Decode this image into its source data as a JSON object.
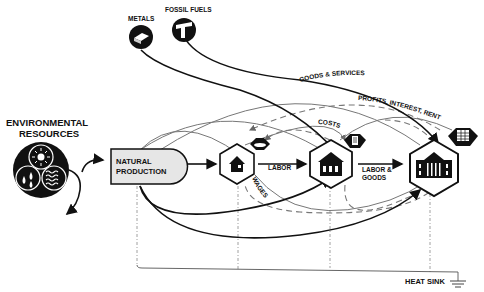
{
  "diagram": {
    "sources": {
      "metals": "METALS",
      "fossil_fuels": "FOSSIL FUELS",
      "environmental_resources_line1": "ENVIRONMENTAL",
      "environmental_resources_line2": "RESOURCES"
    },
    "nodes": {
      "natural_production_line1": "NATURAL",
      "natural_production_line2": "PRODUCTION",
      "household": "household (house icon)",
      "business": "business (building icon)",
      "government": "government (columned building icon)"
    },
    "flows": {
      "labor": "LABOR",
      "labor_goods_line1": "LABOR &",
      "labor_goods_line2": "GOODS",
      "wages": "WAGES",
      "costs": "COSTS",
      "goods_services": "GOODS & SERVICES",
      "profits": "PROFITS, INTEREST, RENT"
    },
    "sink": {
      "heat_sink": "HEAT SINK"
    },
    "colors": {
      "ink": "#111111",
      "secondary_flow": "#777777",
      "production_fill": "#e6e6e6"
    }
  }
}
